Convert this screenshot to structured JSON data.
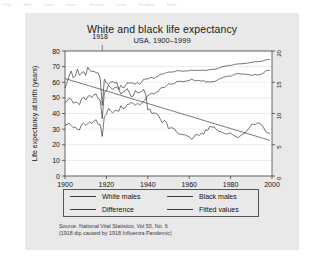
{
  "menubar": {
    "items": [
      "File",
      "Edit",
      "View",
      "Insert",
      "Format",
      "Tools",
      "Window",
      "Help"
    ]
  },
  "figure": {
    "background_color": "#e9e9e9",
    "plot_background_color": "#ffffff",
    "line_color": "#3a3a3a"
  },
  "annotation": {
    "label": "1918"
  },
  "legend": {
    "items": [
      {
        "label": "White males"
      },
      {
        "label": "Black males"
      },
      {
        "label": "Difference"
      },
      {
        "label": "Fitted values"
      }
    ]
  },
  "source": {
    "line1": "Source: National Vital Statistics, Vol 50, No. 6",
    "line2": "(1918 dip caused by 1918 Influenza Pandemic)"
  },
  "chart_data": {
    "type": "line",
    "title": "White and black life expectancy",
    "subtitle": "USA, 1900–1999",
    "xlabel": "Year",
    "ylabel": "Life expectancy at birth (years)",
    "y2label": "",
    "xlim": [
      1900,
      2000
    ],
    "ylim": [
      0,
      80
    ],
    "y2lim": [
      0,
      20
    ],
    "xticks": [
      1900,
      1920,
      1940,
      1960,
      1980,
      2000
    ],
    "yticks": [
      0,
      10,
      20,
      30,
      40,
      50,
      60,
      70,
      80
    ],
    "y2ticks": [
      0,
      5,
      10,
      15,
      20
    ],
    "grid": true,
    "legend_position": "below-axes",
    "annotations": [
      {
        "text": "1918",
        "x": 1918,
        "note": "1918 influenza pandemic dip"
      }
    ],
    "x": [
      1900,
      1901,
      1902,
      1903,
      1904,
      1905,
      1906,
      1907,
      1908,
      1909,
      1910,
      1911,
      1912,
      1913,
      1914,
      1915,
      1916,
      1917,
      1918,
      1919,
      1920,
      1921,
      1922,
      1923,
      1924,
      1925,
      1926,
      1927,
      1928,
      1929,
      1930,
      1931,
      1932,
      1933,
      1934,
      1935,
      1936,
      1937,
      1938,
      1939,
      1940,
      1941,
      1942,
      1943,
      1944,
      1945,
      1946,
      1947,
      1948,
      1949,
      1950,
      1951,
      1952,
      1953,
      1954,
      1955,
      1956,
      1957,
      1958,
      1959,
      1960,
      1961,
      1962,
      1963,
      1964,
      1965,
      1966,
      1967,
      1968,
      1969,
      1970,
      1971,
      1972,
      1973,
      1974,
      1975,
      1976,
      1977,
      1978,
      1979,
      1980,
      1981,
      1982,
      1983,
      1984,
      1985,
      1986,
      1987,
      1988,
      1989,
      1990,
      1991,
      1992,
      1993,
      1994,
      1995,
      1996,
      1997,
      1998,
      1999
    ],
    "series": [
      {
        "name": "White males",
        "axis": "left",
        "values": [
          46.6,
          48.0,
          49.8,
          49.1,
          46.6,
          47.3,
          46.9,
          45.6,
          49.5,
          50.5,
          48.6,
          50.9,
          51.5,
          50.3,
          52.0,
          52.5,
          49.6,
          48.6,
          36.6,
          53.5,
          54.4,
          58.1,
          56.6,
          55.5,
          56.6,
          57.0,
          55.3,
          58.1,
          56.4,
          57.1,
          59.7,
          59.4,
          59.7,
          59.2,
          58.9,
          59.9,
          58.8,
          60.0,
          61.9,
          62.1,
          62.1,
          62.8,
          63.1,
          62.4,
          63.6,
          63.8,
          65.1,
          65.2,
          65.5,
          66.2,
          66.5,
          66.5,
          66.6,
          66.8,
          67.4,
          67.3,
          67.3,
          67.0,
          67.2,
          67.3,
          67.4,
          67.8,
          67.6,
          67.5,
          67.7,
          67.6,
          67.6,
          67.8,
          67.5,
          67.8,
          68.0,
          68.3,
          68.3,
          68.4,
          68.9,
          69.5,
          69.9,
          70.2,
          70.4,
          70.8,
          70.7,
          71.1,
          71.5,
          71.6,
          71.8,
          71.8,
          71.9,
          72.1,
          72.2,
          72.5,
          72.7,
          72.9,
          73.2,
          73.1,
          73.3,
          73.4,
          73.8,
          74.3,
          74.5,
          74.6
        ]
      },
      {
        "name": "Black males",
        "axis": "left",
        "values": [
          32.5,
          33.0,
          33.8,
          32.3,
          30.9,
          31.3,
          29.8,
          29.5,
          33.0,
          33.8,
          32.5,
          33.5,
          34.6,
          33.6,
          35.2,
          36.0,
          33.1,
          33.0,
          25.3,
          38.0,
          39.5,
          43.4,
          41.6,
          40.4,
          41.7,
          42.0,
          41.4,
          45.0,
          43.0,
          43.5,
          45.7,
          46.0,
          47.0,
          46.4,
          45.2,
          46.6,
          45.4,
          46.5,
          48.0,
          49.1,
          51.5,
          52.1,
          53.1,
          52.3,
          53.6,
          54.0,
          56.0,
          56.7,
          56.6,
          57.6,
          58.9,
          58.8,
          58.9,
          59.3,
          60.4,
          60.6,
          60.6,
          60.4,
          60.6,
          60.9,
          61.1,
          61.9,
          61.5,
          60.9,
          61.1,
          61.1,
          60.7,
          61.1,
          60.1,
          60.5,
          60.0,
          60.5,
          60.4,
          60.9,
          61.7,
          62.4,
          62.9,
          63.4,
          63.7,
          64.0,
          63.8,
          64.5,
          65.1,
          65.4,
          65.6,
          65.3,
          65.2,
          65.2,
          64.9,
          64.8,
          64.5,
          64.6,
          65.0,
          64.6,
          64.9,
          65.2,
          66.1,
          67.2,
          67.6,
          67.8
        ]
      },
      {
        "name": "Difference",
        "axis": "right",
        "values": [
          14.1,
          15.0,
          16.0,
          16.8,
          15.7,
          16.0,
          17.1,
          16.1,
          16.5,
          16.7,
          16.1,
          17.4,
          16.9,
          16.7,
          16.8,
          16.5,
          16.5,
          15.6,
          11.3,
          15.5,
          14.9,
          14.7,
          15.0,
          15.1,
          14.9,
          15.0,
          13.9,
          13.1,
          13.4,
          13.6,
          14.0,
          13.4,
          12.7,
          12.8,
          13.7,
          13.3,
          13.4,
          13.5,
          13.9,
          13.0,
          10.6,
          10.7,
          10.0,
          10.1,
          10.0,
          9.8,
          9.1,
          8.5,
          8.9,
          8.6,
          7.6,
          7.7,
          7.7,
          7.5,
          7.0,
          6.7,
          6.7,
          6.6,
          6.6,
          6.4,
          6.3,
          5.9,
          6.1,
          6.6,
          6.6,
          6.5,
          6.9,
          6.7,
          7.4,
          7.3,
          8.0,
          7.8,
          7.9,
          7.5,
          7.2,
          7.1,
          7.0,
          6.8,
          6.7,
          6.8,
          6.9,
          6.6,
          6.4,
          6.2,
          6.2,
          6.5,
          6.7,
          6.9,
          7.3,
          7.7,
          8.2,
          8.3,
          8.2,
          8.5,
          8.4,
          8.2,
          7.7,
          7.1,
          6.9,
          6.8
        ]
      },
      {
        "name": "Fitted values",
        "axis": "right",
        "values": [
          15.6,
          15.5,
          15.4,
          15.3,
          15.2,
          15.1,
          15.0,
          14.9,
          14.8,
          14.7,
          14.6,
          14.5,
          14.4,
          14.3,
          14.2,
          14.1,
          14.0,
          13.9,
          13.8,
          13.7,
          13.6,
          13.5,
          13.4,
          13.3,
          13.2,
          13.1,
          13.0,
          12.9,
          12.8,
          12.7,
          12.6,
          12.5,
          12.4,
          12.3,
          12.2,
          12.1,
          12.0,
          11.9,
          11.8,
          11.7,
          11.6,
          11.5,
          11.4,
          11.3,
          11.2,
          11.1,
          11.0,
          10.9,
          10.8,
          10.7,
          10.6,
          10.5,
          10.4,
          10.3,
          10.2,
          10.1,
          10.0,
          9.9,
          9.8,
          9.7,
          9.6,
          9.5,
          9.4,
          9.3,
          9.2,
          9.1,
          9.0,
          8.9,
          8.8,
          8.7,
          8.6,
          8.5,
          8.4,
          8.3,
          8.2,
          8.1,
          8.0,
          7.9,
          7.8,
          7.7,
          7.6,
          7.5,
          7.4,
          7.3,
          7.2,
          7.1,
          7.0,
          6.9,
          6.8,
          6.7,
          6.6,
          6.5,
          6.4,
          6.3,
          6.2,
          6.1,
          6.0,
          5.9,
          5.8,
          5.7
        ]
      }
    ]
  }
}
